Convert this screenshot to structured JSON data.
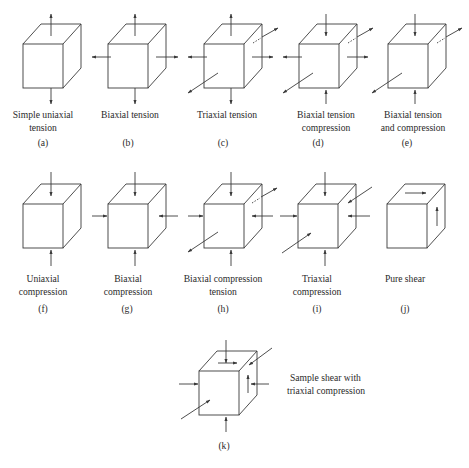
{
  "figure": {
    "style": {
      "line_color": "#3a3a3a",
      "background": "#ffffff"
    },
    "panels": [
      {
        "id": "a",
        "label": "(a)",
        "caption_lines": [
          "Simple uniaxial",
          "tension"
        ],
        "arrows": [
          "top-out",
          "bottom-out"
        ]
      },
      {
        "id": "b",
        "label": "(b)",
        "caption_lines": [
          "Biaxial tension"
        ],
        "arrows": [
          "top-out",
          "bottom-out",
          "left-out",
          "right-out"
        ]
      },
      {
        "id": "c",
        "label": "(c)",
        "caption_lines": [
          "Triaxial tension"
        ],
        "arrows": [
          "top-out",
          "bottom-out",
          "left-out",
          "right-out",
          "front-out",
          "back-out"
        ]
      },
      {
        "id": "d",
        "label": "(d)",
        "caption_lines": [
          "Biaxial tension",
          "compression"
        ],
        "arrows": [
          "top-in",
          "bottom-in",
          "left-out",
          "right-out",
          "front-out",
          "back-out"
        ]
      },
      {
        "id": "e",
        "label": "(e)",
        "caption_lines": [
          "Biaxial tension",
          "and compression"
        ],
        "arrows": [
          "top-in",
          "bottom-in",
          "front-out",
          "back-out"
        ]
      },
      {
        "id": "f",
        "label": "(f)",
        "caption_lines": [
          "Uniaxial",
          "compression"
        ],
        "arrows": [
          "top-in",
          "bottom-in"
        ]
      },
      {
        "id": "g",
        "label": "(g)",
        "caption_lines": [
          "Biaxial",
          "compression"
        ],
        "arrows": [
          "top-in",
          "bottom-in",
          "left-in",
          "right-in"
        ]
      },
      {
        "id": "h",
        "label": "(h)",
        "caption_lines": [
          "Biaxial compression",
          "tension"
        ],
        "arrows": [
          "top-in",
          "bottom-in",
          "left-in",
          "right-in",
          "front-out",
          "back-out"
        ]
      },
      {
        "id": "i",
        "label": "(i)",
        "caption_lines": [
          "Triaxial",
          "compression"
        ],
        "arrows": [
          "top-in",
          "bottom-in",
          "left-in",
          "right-in",
          "front-in",
          "back-in"
        ]
      },
      {
        "id": "j",
        "label": "(j)",
        "caption_lines": [
          "Pure shear"
        ],
        "arrows": [
          "shear-top-right",
          "shear-side-up"
        ]
      },
      {
        "id": "k",
        "label": "(k)",
        "caption_lines": [
          "Sample shear with",
          "triaxial compression"
        ],
        "arrows": [
          "top-in",
          "bottom-in",
          "left-in",
          "right-in",
          "front-in",
          "back-in",
          "shear-top-right",
          "shear-side-up"
        ]
      }
    ]
  }
}
